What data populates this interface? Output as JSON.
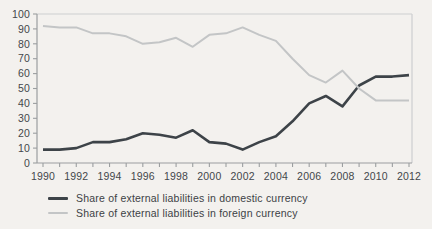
{
  "chart_data": {
    "type": "line",
    "title": "",
    "xlabel": "",
    "ylabel": "",
    "x": [
      1990,
      1991,
      1992,
      1993,
      1994,
      1995,
      1996,
      1997,
      1998,
      1999,
      2000,
      2001,
      2002,
      2003,
      2004,
      2005,
      2006,
      2007,
      2008,
      2009,
      2010,
      2011,
      2012
    ],
    "x_labeled_ticks": [
      1990,
      1992,
      1994,
      1996,
      1998,
      2000,
      2002,
      2004,
      2006,
      2008,
      2010,
      2012
    ],
    "y_ticks": [
      0,
      10,
      20,
      30,
      40,
      50,
      60,
      70,
      80,
      90,
      100
    ],
    "ylim": [
      0,
      100
    ],
    "grid": false,
    "legend_position": "bottom-left",
    "series": [
      {
        "name": "Share of external liabilities in domestic currency",
        "color": "#3d4348",
        "stroke_width": 2.6,
        "values": [
          9,
          9,
          10,
          14,
          14,
          16,
          20,
          19,
          17,
          22,
          14,
          13,
          9,
          14,
          18,
          28,
          40,
          45,
          38,
          52,
          58,
          58,
          59
        ]
      },
      {
        "name": "Share of external liabilities in foreign currency",
        "color": "#c3c5c6",
        "stroke_width": 2,
        "values": [
          92,
          91,
          91,
          87,
          87,
          85,
          80,
          81,
          84,
          78,
          86,
          87,
          91,
          86,
          82,
          70,
          59,
          54,
          62,
          50,
          42,
          42,
          42
        ]
      }
    ]
  },
  "style": {
    "axis_color": "#9b9ea0",
    "border_color": "#cdcfd0",
    "tick_label_color": "#43474b",
    "background": "#f3f1ee"
  }
}
